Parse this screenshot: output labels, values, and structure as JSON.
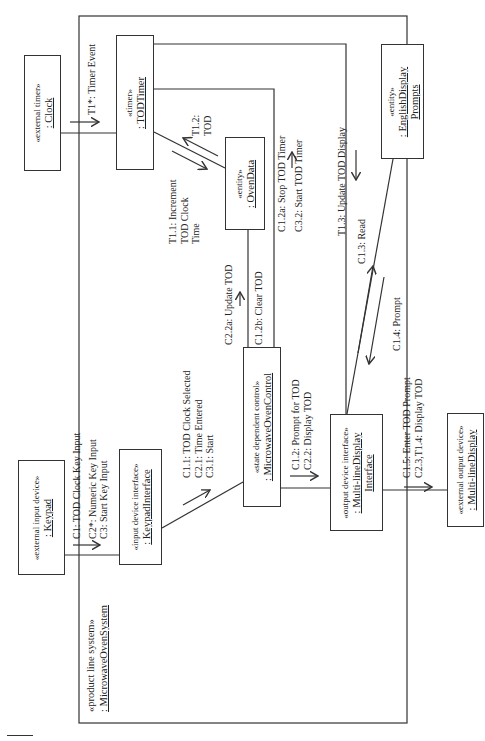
{
  "diagram": {
    "type": "UML communication diagram",
    "orientation": "rotated 90 degrees counter-clockwise",
    "system": {
      "stereotype": "«product line system»",
      "name": ": MicrowaveOvenSystem"
    },
    "objects": {
      "clock": {
        "stereotype": "«external timer»",
        "name": ": Clock"
      },
      "tod_timer": {
        "stereotype": "«timer»",
        "name": ": TODTimer"
      },
      "oven_data": {
        "stereotype": "«entity»",
        "name": ": OvenData"
      },
      "english_prompts": {
        "stereotype": "«entity»",
        "name_line1": ": EnglishDisplay",
        "name_line2": "Prompts"
      },
      "oven_control": {
        "stereotype": "«state dependent control»",
        "name": ": MicrowaveOvenControl"
      },
      "keypad_interface": {
        "stereotype": "«input device interface»",
        "name": ": KeypadInterface"
      },
      "keypad": {
        "stereotype": "«external input device»",
        "name": ": Keypad"
      },
      "display_interface": {
        "stereotype": "«output device interface»",
        "name_line1": ": Multi-lineDisplay",
        "name_line2": "Interface"
      },
      "display": {
        "stereotype": "«external output device»",
        "name": ": Multi-lineDisplay"
      }
    },
    "messages": {
      "t1": [
        "T1*: Timer Event"
      ],
      "t1_1": [
        "T1.1: Increment",
        "TOD Clock",
        "Time"
      ],
      "t1_2": [
        "T1.2:",
        "TOD"
      ],
      "c1_2a_c3_2": [
        "C1.2a: Stop TOD Timer",
        "C3.2: Start TOD Timer"
      ],
      "t1_3": [
        "T1.3: Update TOD Display"
      ],
      "c2_2a": [
        "C2.2a: Update TOD"
      ],
      "c1_2b": [
        "C1.2b: Clear TOD"
      ],
      "c1_3": [
        "C1.3: Read"
      ],
      "c1_4": [
        "C1.4: Prompt"
      ],
      "keypad_in": [
        "C1: TOD Clock Key Input",
        "C2*: Numeric Key Input",
        "C3: Start Key Input"
      ],
      "to_control": [
        "C1.1: TOD Clock Selected",
        "C2.1: Time Entered",
        "C3.1: Start"
      ],
      "to_display_if": [
        "C1.2: Prompt for TOD",
        "C2.2: Display TOD"
      ],
      "to_display": [
        "C1.5: Enter TOD Prompt",
        "C2.3,T1.4: Display TOD"
      ]
    }
  },
  "colors": {
    "line": "#333333",
    "text": "#222222",
    "background": "#ffffff"
  }
}
